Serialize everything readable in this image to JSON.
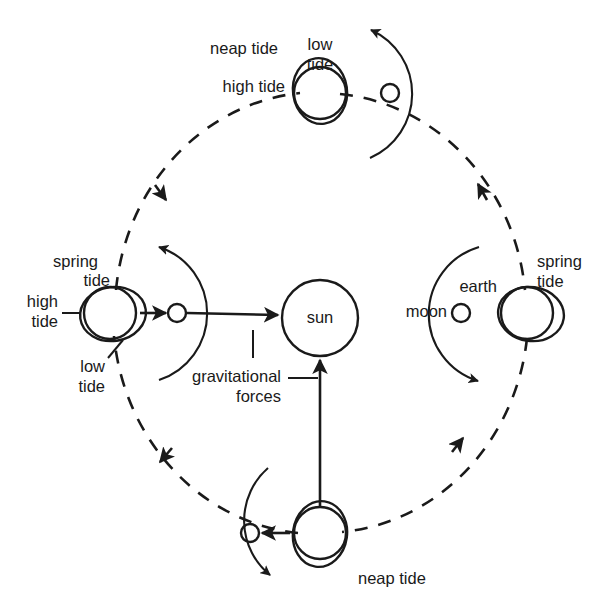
{
  "diagram": {
    "type": "astronomy-schematic",
    "background_color": "#ffffff",
    "ink_color": "#1a1a1a"
  },
  "center_body": {
    "name": "sun",
    "label": "sun",
    "cx": 320,
    "cy": 318,
    "r": 38
  },
  "orbit": {
    "name": "earth-orbit",
    "style": "dashed",
    "direction": "counterclockwise",
    "cx": 320,
    "cy": 313,
    "rx": 205,
    "ry": 220
  },
  "positions": [
    {
      "id": "left",
      "tide_name": "spring tide",
      "tide_labels": [
        "spring\ntide",
        "high\ntide",
        "low\ntide"
      ],
      "spring_label_lines": [
        "spring",
        "tide"
      ],
      "high_label_lines": [
        "high",
        "tide"
      ],
      "low_label_lines": [
        "low",
        "tide"
      ],
      "earth_label": "",
      "moon_label": "",
      "earth_cx": 110,
      "earth_cy": 313,
      "moon_cx": 177,
      "moon_cy": 313,
      "alignment": "moon between earth and sun",
      "force_arrow": "earth-to-moon-to-sun"
    },
    {
      "id": "top",
      "tide_name": "neap tide",
      "neap_label": "neap tide",
      "high_label": "high tide",
      "low_label_lines": [
        "low",
        "tide"
      ],
      "earth_cx": 320,
      "earth_cy": 93,
      "moon_cx": 390,
      "moon_cy": 93,
      "alignment": "moon perpendicular to sun direction"
    },
    {
      "id": "right",
      "tide_name": "spring tide",
      "spring_label_lines": [
        "spring",
        "tide"
      ],
      "earth_label": "earth",
      "moon_label": "moon",
      "earth_cx": 527,
      "earth_cy": 313,
      "moon_cx": 461,
      "moon_cy": 313,
      "alignment": "moon between earth and sun"
    },
    {
      "id": "bottom",
      "tide_name": "neap tide",
      "neap_label": "neap tide",
      "earth_cx": 320,
      "earth_cy": 533,
      "moon_cx": 250,
      "moon_cy": 533,
      "alignment": "moon perpendicular to sun direction"
    }
  ],
  "annotations": {
    "gravitational_forces_lines": [
      "gravitational",
      "forces"
    ],
    "gravitational_forces": "gravitational forces"
  }
}
